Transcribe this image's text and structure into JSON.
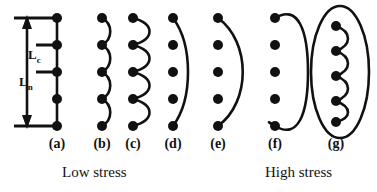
{
  "figure": {
    "stroke_color": "#111111",
    "dot_color": "#111111",
    "background": "#ffffff"
  },
  "dimensions": {
    "lc": {
      "label": "L",
      "subscript": "c"
    },
    "ln": {
      "label": "L",
      "subscript": "n"
    }
  },
  "panels": [
    {
      "id": "a",
      "label": "(a)",
      "type": "straight-line-pinned",
      "dots": 5
    },
    {
      "id": "b",
      "label": "(b)",
      "type": "small-amplitude-wavy",
      "dots": 5
    },
    {
      "id": "c",
      "label": "(c)",
      "type": "large-amplitude-wavy",
      "dots": 5
    },
    {
      "id": "d",
      "label": "(d)",
      "type": "narrow-bowed-arc",
      "dots": 5
    },
    {
      "id": "e",
      "label": "(e)",
      "type": "wide-bowed-arc",
      "dots": 5
    },
    {
      "id": "f",
      "label": "(f)",
      "type": "closed-loop",
      "dots": 5
    },
    {
      "id": "g",
      "label": "(g)",
      "type": "closed-loop-with-wavy-line",
      "dots": 5
    }
  ],
  "captions": {
    "low": "Low stress",
    "high": "High stress"
  }
}
